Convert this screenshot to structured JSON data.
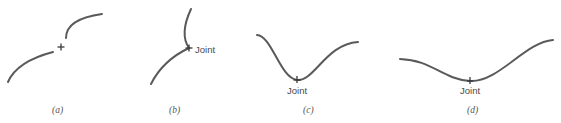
{
  "panels": [
    {
      "id": "a",
      "caption": "(a)",
      "joint_label": ""
    },
    {
      "id": "b",
      "caption": "(b)",
      "joint_label": "Joint"
    },
    {
      "id": "c",
      "caption": "(c)",
      "joint_label": "Joint"
    },
    {
      "id": "d",
      "caption": "(d)",
      "joint_label": "Joint"
    }
  ],
  "colors": {
    "curve": "#5a5a5a",
    "text": "#4a4a4a"
  }
}
